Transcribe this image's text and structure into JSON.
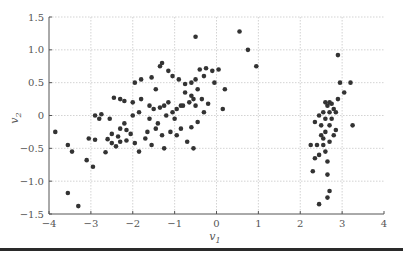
{
  "chart_data": {
    "type": "scatter",
    "title": "",
    "xlabel": "v1",
    "ylabel": "v2",
    "xlim": [
      -4,
      4
    ],
    "ylim": [
      -1.5,
      1.5
    ],
    "xticks": [
      -4,
      -3,
      -2,
      -1,
      0,
      1,
      2,
      3,
      4
    ],
    "xtick_labels": [
      "−4",
      "−3",
      "−2",
      "−1",
      "0",
      "1",
      "2",
      "3",
      "4"
    ],
    "yticks": [
      -1.5,
      -1.0,
      -0.5,
      0,
      0.5,
      1.0,
      1.5
    ],
    "ytick_labels": [
      "−1.5",
      "−1.0",
      "−0.5",
      "0",
      "0.5",
      "1.0",
      "1.5"
    ],
    "grid": true,
    "legend": null,
    "marker_color": "#333333",
    "series": [
      {
        "name": "points",
        "points": [
          [
            -3.85,
            -0.25
          ],
          [
            -3.55,
            -0.45
          ],
          [
            -3.45,
            -0.55
          ],
          [
            -3.55,
            -1.18
          ],
          [
            -3.3,
            -1.38
          ],
          [
            -3.1,
            -0.68
          ],
          [
            -2.95,
            -0.78
          ],
          [
            -3.05,
            -0.35
          ],
          [
            -2.9,
            -0.37
          ],
          [
            -2.6,
            -0.36
          ],
          [
            -2.65,
            -0.56
          ],
          [
            -2.5,
            -0.28
          ],
          [
            -2.35,
            -0.32
          ],
          [
            -2.3,
            -0.2
          ],
          [
            -2.15,
            -0.22
          ],
          [
            -2.5,
            -0.42
          ],
          [
            -2.4,
            -0.47
          ],
          [
            -2.15,
            -0.38
          ],
          [
            -1.95,
            -0.42
          ],
          [
            -2.2,
            -0.12
          ],
          [
            -2.55,
            -0.05
          ],
          [
            -2.8,
            -0.05
          ],
          [
            -2.9,
            0.0
          ],
          [
            -2.75,
            0.02
          ],
          [
            -2.3,
            0.25
          ],
          [
            -2.2,
            0.22
          ],
          [
            -2.0,
            0.2
          ],
          [
            -1.8,
            0.25
          ],
          [
            -2.45,
            0.27
          ],
          [
            -2.0,
            0.0
          ],
          [
            -1.85,
            0.05
          ],
          [
            -1.6,
            -0.05
          ],
          [
            -1.65,
            -0.25
          ],
          [
            -1.45,
            -0.2
          ],
          [
            -1.3,
            -0.3
          ],
          [
            -1.1,
            -0.25
          ],
          [
            -0.95,
            -0.3
          ],
          [
            -1.25,
            -0.5
          ],
          [
            -1.55,
            -0.45
          ],
          [
            -1.85,
            -0.55
          ],
          [
            -1.95,
            0.5
          ],
          [
            -1.8,
            0.55
          ],
          [
            -1.55,
            0.58
          ],
          [
            -1.45,
            0.4
          ],
          [
            -1.35,
            0.75
          ],
          [
            -1.3,
            0.8
          ],
          [
            -1.6,
            0.15
          ],
          [
            -1.5,
            0.1
          ],
          [
            -1.35,
            0.12
          ],
          [
            -1.25,
            0.15
          ],
          [
            -1.15,
            0.2
          ],
          [
            -1.05,
            0.05
          ],
          [
            -0.95,
            0.1
          ],
          [
            -0.85,
            0.15
          ],
          [
            -1.2,
            0.0
          ],
          [
            -1.0,
            -0.05
          ],
          [
            -0.75,
            0.35
          ],
          [
            -0.6,
            0.3
          ],
          [
            -0.55,
            0.25
          ],
          [
            -0.5,
            0.55
          ],
          [
            -0.4,
            0.7
          ],
          [
            -0.3,
            0.6
          ],
          [
            -0.25,
            0.72
          ],
          [
            -0.1,
            0.68
          ],
          [
            -0.05,
            0.5
          ],
          [
            0.05,
            0.7
          ],
          [
            -0.45,
            0.4
          ],
          [
            -0.6,
            0.5
          ],
          [
            -0.75,
            0.48
          ],
          [
            -0.9,
            0.55
          ],
          [
            -1.05,
            0.6
          ],
          [
            -1.15,
            0.68
          ],
          [
            -0.8,
            0.15
          ],
          [
            -0.65,
            0.2
          ],
          [
            -0.5,
            0.15
          ],
          [
            -0.35,
            0.25
          ],
          [
            -0.2,
            0.18
          ],
          [
            -0.3,
            0.05
          ],
          [
            -0.45,
            -0.1
          ],
          [
            -0.6,
            -0.18
          ],
          [
            -0.85,
            -0.2
          ],
          [
            -0.7,
            -0.4
          ],
          [
            -0.55,
            -0.5
          ],
          [
            0.2,
            0.4
          ],
          [
            0.15,
            0.1
          ],
          [
            -0.5,
            1.2
          ],
          [
            0.55,
            1.28
          ],
          [
            0.75,
            1.0
          ],
          [
            0.95,
            0.75
          ],
          [
            -1.4,
            -0.12
          ],
          [
            -1.7,
            -0.35
          ],
          [
            -2.05,
            -0.28
          ],
          [
            -2.3,
            -0.4
          ],
          [
            2.3,
            -0.85
          ],
          [
            2.35,
            -0.65
          ],
          [
            2.45,
            -1.35
          ],
          [
            2.4,
            -0.45
          ],
          [
            2.25,
            -0.45
          ],
          [
            2.5,
            -0.3
          ],
          [
            2.5,
            -0.15
          ],
          [
            2.35,
            -0.1
          ],
          [
            2.45,
            0.0
          ],
          [
            2.55,
            0.05
          ],
          [
            2.6,
            -0.05
          ],
          [
            2.65,
            0.15
          ],
          [
            2.7,
            0.2
          ],
          [
            2.75,
            0.18
          ],
          [
            2.8,
            0.1
          ],
          [
            2.85,
            0.05
          ],
          [
            2.9,
            0.25
          ],
          [
            2.95,
            0.5
          ],
          [
            3.05,
            0.35
          ],
          [
            3.2,
            0.5
          ],
          [
            2.9,
            0.92
          ],
          [
            2.55,
            -0.45
          ],
          [
            2.6,
            -0.55
          ],
          [
            2.65,
            -0.7
          ],
          [
            2.7,
            -0.4
          ],
          [
            2.65,
            -0.9
          ],
          [
            2.7,
            -1.15
          ],
          [
            2.65,
            -1.25
          ],
          [
            2.6,
            -0.25
          ],
          [
            2.55,
            -0.35
          ],
          [
            2.7,
            -0.15
          ],
          [
            2.75,
            -0.05
          ],
          [
            2.8,
            -0.3
          ],
          [
            2.85,
            -0.22
          ],
          [
            3.25,
            -0.15
          ],
          [
            2.45,
            -0.6
          ],
          [
            2.6,
            0.2
          ],
          [
            2.7,
            0.05
          ]
        ]
      }
    ]
  }
}
